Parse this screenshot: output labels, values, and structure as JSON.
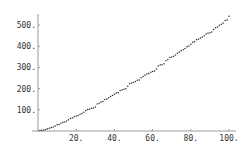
{
  "chart_data": {
    "type": "scatter",
    "title": "",
    "xlabel": "",
    "ylabel": "",
    "xlim": [
      0,
      100
    ],
    "ylim": [
      0,
      560
    ],
    "grid": false,
    "legend": null,
    "x_ticks": [
      20,
      40,
      60,
      80,
      100
    ],
    "x_tick_labels": [
      "20.",
      "40.",
      "60.",
      "80.",
      "100."
    ],
    "y_ticks": [
      100,
      200,
      300,
      400,
      500
    ],
    "y_tick_labels": [
      "100.",
      "200.",
      "300.",
      "400.",
      "500."
    ],
    "series": [
      {
        "name": "points",
        "color": "#2a2a2a",
        "x": [
          1,
          2,
          3,
          4,
          5,
          6,
          7,
          8,
          9,
          10,
          11,
          12,
          13,
          14,
          15,
          16,
          17,
          18,
          19,
          20,
          21,
          22,
          23,
          24,
          25,
          26,
          27,
          28,
          29,
          30,
          31,
          32,
          33,
          34,
          35,
          36,
          37,
          38,
          39,
          40,
          41,
          42,
          43,
          44,
          45,
          46,
          47,
          48,
          49,
          50,
          51,
          52,
          53,
          54,
          55,
          56,
          57,
          58,
          59,
          60,
          61,
          62,
          63,
          64,
          65,
          66,
          67,
          68,
          69,
          70,
          71,
          72,
          73,
          74,
          75,
          76,
          77,
          78,
          79,
          80,
          81,
          82,
          83,
          84,
          85,
          86,
          87,
          88,
          89,
          90,
          91,
          92,
          93,
          94,
          95,
          96,
          97,
          98,
          99,
          100
        ],
        "values": [
          2,
          3,
          5,
          7,
          11,
          13,
          17,
          19,
          23,
          29,
          31,
          37,
          41,
          43,
          47,
          53,
          59,
          61,
          67,
          71,
          73,
          79,
          83,
          89,
          97,
          101,
          103,
          107,
          109,
          113,
          127,
          131,
          137,
          139,
          149,
          151,
          157,
          163,
          167,
          173,
          179,
          181,
          191,
          193,
          197,
          199,
          211,
          223,
          227,
          229,
          233,
          239,
          241,
          251,
          257,
          263,
          269,
          271,
          277,
          281,
          283,
          293,
          307,
          311,
          313,
          317,
          331,
          337,
          347,
          349,
          353,
          359,
          367,
          373,
          379,
          383,
          389,
          397,
          401,
          409,
          419,
          421,
          431,
          433,
          439,
          443,
          449,
          457,
          461,
          463,
          467,
          479,
          487,
          491,
          499,
          503,
          509,
          521,
          523,
          541
        ]
      }
    ]
  },
  "layout": {
    "origin_px": [
      38,
      131
    ],
    "x_px_per_unit": 1.91,
    "y_px_per_unit": 0.212,
    "y_axis_top_px": 14,
    "x_axis_right_px": 236
  }
}
